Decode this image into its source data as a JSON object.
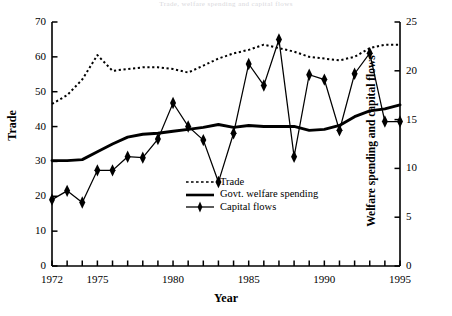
{
  "figure": {
    "faint_top_title": "Trade, welfare spending and capital flows",
    "xlabel": "Year",
    "ylabel_left": "Trade",
    "ylabel_right": "Welfare spending and capital flows"
  },
  "legend": {
    "items": [
      {
        "label": "Trade",
        "key": "dotted-line-key"
      },
      {
        "label": "Govt. welfare spending",
        "key": "solid-line-key"
      },
      {
        "label": "Capital flows",
        "key": "diamond-marker-line-key"
      }
    ]
  },
  "axes": {
    "y_left_ticks": [
      "0",
      "10",
      "20",
      "30",
      "40",
      "50",
      "60",
      "70"
    ],
    "y_right_ticks": [
      "0",
      "5",
      "10",
      "15",
      "20",
      "25"
    ],
    "x_ticks_labeled": [
      "1972",
      "1975",
      "1980",
      "1985",
      "1990",
      "1995"
    ]
  },
  "chart_data": {
    "type": "line",
    "title": "Trade, welfare spending and capital flows",
    "xlabel": "Year",
    "ylabel": "Trade",
    "y2label": "Welfare spending and capital flows",
    "xlim": [
      1972,
      1995
    ],
    "ylim": [
      0,
      70
    ],
    "y2lim": [
      0,
      25
    ],
    "grid": false,
    "legend_position": "center",
    "x": [
      1972,
      1973,
      1974,
      1975,
      1976,
      1977,
      1978,
      1979,
      1980,
      1981,
      1982,
      1983,
      1984,
      1985,
      1986,
      1987,
      1988,
      1989,
      1990,
      1991,
      1992,
      1993,
      1994,
      1995
    ],
    "series": [
      {
        "name": "Trade",
        "axis": "left",
        "style": "dotted",
        "values": [
          46.5,
          49.0,
          53.5,
          60.5,
          56.0,
          56.5,
          57.0,
          57.0,
          56.5,
          55.5,
          57.5,
          59.5,
          61.0,
          62.0,
          63.5,
          62.5,
          61.5,
          60.0,
          59.5,
          59.0,
          60.0,
          62.5,
          63.5,
          63.5
        ]
      },
      {
        "name": "Govt. welfare spending",
        "axis": "right",
        "style": "solid",
        "values": [
          10.8,
          10.8,
          10.9,
          11.7,
          12.5,
          13.2,
          13.5,
          13.6,
          13.8,
          14.0,
          14.2,
          14.5,
          14.2,
          14.4,
          14.3,
          14.3,
          14.3,
          13.9,
          14.0,
          14.4,
          15.3,
          15.9,
          16.1,
          16.5
        ]
      },
      {
        "name": "Capital flows",
        "axis": "right",
        "style": "solid-with-diamonds",
        "values": [
          6.8,
          7.7,
          6.5,
          9.8,
          9.8,
          11.2,
          11.1,
          13.0,
          16.7,
          14.3,
          12.9,
          8.6,
          13.6,
          20.7,
          18.5,
          23.2,
          11.2,
          19.6,
          19.1,
          13.9,
          19.7,
          21.8,
          14.8,
          14.8
        ]
      }
    ]
  }
}
